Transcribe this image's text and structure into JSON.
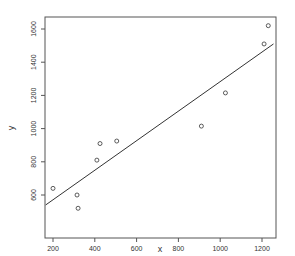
{
  "chart_data": {
    "type": "scatter",
    "title": "",
    "xlabel": "x",
    "ylabel": "y",
    "xlim": [
      165,
      1255
    ],
    "ylim": [
      470,
      1660
    ],
    "x_ticks": [
      200,
      400,
      600,
      800,
      1000,
      1200
    ],
    "y_ticks": [
      600,
      800,
      1000,
      1200,
      1400,
      1600
    ],
    "grid": false,
    "legend": null,
    "points": [
      {
        "x": 200,
        "y": 640
      },
      {
        "x": 315,
        "y": 600
      },
      {
        "x": 320,
        "y": 520
      },
      {
        "x": 410,
        "y": 810
      },
      {
        "x": 425,
        "y": 910
      },
      {
        "x": 505,
        "y": 925
      },
      {
        "x": 910,
        "y": 1015
      },
      {
        "x": 1025,
        "y": 1215
      },
      {
        "x": 1210,
        "y": 1510
      },
      {
        "x": 1230,
        "y": 1620
      }
    ],
    "regression_line": {
      "x1": 165,
      "y1": 540,
      "x2": 1255,
      "y2": 1510
    },
    "colors": {
      "points": "#333333",
      "line": "#333333",
      "axis": "#555555"
    }
  }
}
